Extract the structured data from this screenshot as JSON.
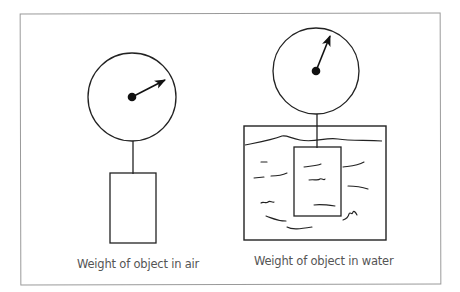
{
  "diagram": {
    "type": "physics-illustration",
    "panels": [
      {
        "id": "air",
        "caption": "Weight of object in air",
        "scale_needle_angle_deg": -27
      },
      {
        "id": "water",
        "caption": "Weight of object in water",
        "scale_needle_angle_deg": -62
      }
    ]
  }
}
